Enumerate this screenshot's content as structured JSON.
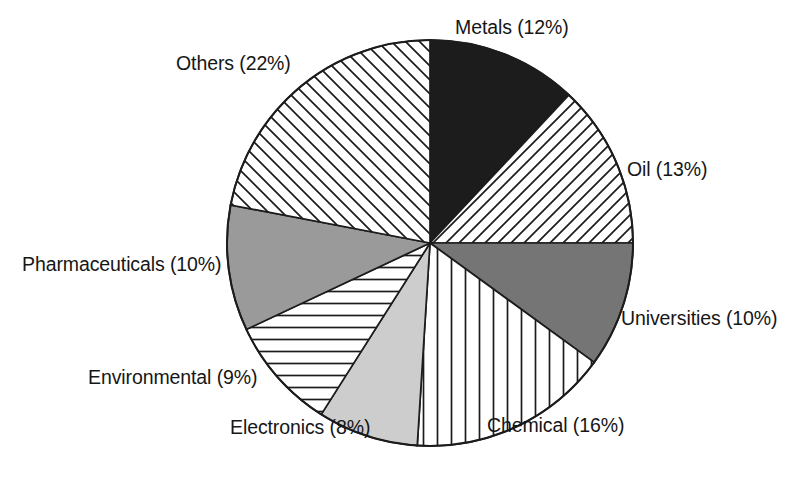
{
  "chart_data": {
    "type": "pie",
    "title": "",
    "subtitle": "",
    "xlabel": "",
    "ylabel": "",
    "legend_position": "none",
    "grid": false,
    "start_angle_deg": 0,
    "direction": "clockwise",
    "units": "percent",
    "total": 100,
    "categories": [
      "Metals",
      "Oil",
      "Universities",
      "Chemical",
      "Electronics",
      "Environmental",
      "Pharmaceuticals",
      "Others"
    ],
    "values": [
      12,
      13,
      10,
      16,
      8,
      9,
      10,
      22
    ],
    "labels": [
      "Metals (12%)",
      "Oil (13%)",
      "Universities (10%)",
      "Chemical (16%)",
      "Electronics (8%)",
      "Environmental (9%)",
      "Pharmaceuticals (10%)",
      "Others (22%)"
    ],
    "slices": [
      {
        "name": "Metals",
        "label": "Metals (12%)",
        "value": 12,
        "fill_style": "solid-black",
        "color": "#1c1c1c"
      },
      {
        "name": "Oil",
        "label": "Oil (13%)",
        "value": 13,
        "fill_style": "diagonal-hatch-up",
        "color": "#ffffff"
      },
      {
        "name": "Universities",
        "label": "Universities (10%)",
        "value": 10,
        "fill_style": "solid-dark-gray",
        "color": "#757575"
      },
      {
        "name": "Chemical",
        "label": "Chemical (16%)",
        "value": 16,
        "fill_style": "vertical-lines",
        "color": "#ffffff"
      },
      {
        "name": "Electronics",
        "label": "Electronics (8%)",
        "value": 8,
        "fill_style": "solid-light-gray",
        "color": "#cdcdcd"
      },
      {
        "name": "Environmental",
        "label": "Environmental (9%)",
        "value": 9,
        "fill_style": "horizontal-lines",
        "color": "#ffffff"
      },
      {
        "name": "Pharmaceuticals",
        "label": "Pharmaceuticals (10%)",
        "value": 10,
        "fill_style": "solid-mid-gray",
        "color": "#9a9a9a"
      },
      {
        "name": "Others",
        "label": "Others (22%)",
        "value": 22,
        "fill_style": "diagonal-hatch-down",
        "color": "#ffffff"
      }
    ]
  },
  "figure": {
    "background": "#ffffff",
    "outline_color": "#1c1c1c",
    "center_x": 430,
    "center_y": 243,
    "radius": 203
  }
}
